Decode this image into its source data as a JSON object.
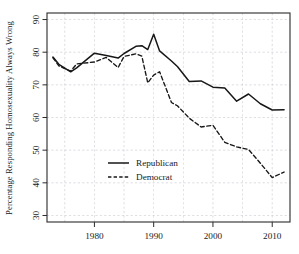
{
  "chart_data": {
    "type": "line",
    "title": "",
    "subtitle": "",
    "xlabel": "",
    "ylabel": "Percentage Responding Homosexuality Always Wrong",
    "xlim": [
      1972,
      2013
    ],
    "ylim": [
      28,
      92
    ],
    "yticks": [
      30,
      40,
      50,
      60,
      70,
      80,
      90
    ],
    "ytick_labels": [
      "30",
      "40",
      "50",
      "60",
      "70",
      "80",
      "90"
    ],
    "xticks": [
      1980,
      1990,
      2000,
      2010
    ],
    "xtick_labels": [
      "1980",
      "1990",
      "2000",
      "2010"
    ],
    "grid": true,
    "grid_style": "dashed",
    "legend_position": "center-left",
    "series": [
      {
        "name": "Republican",
        "style": "solid",
        "color": "#171717",
        "x": [
          1973,
          1974,
          1976,
          1977,
          1980,
          1982,
          1984,
          1985,
          1987,
          1988,
          1989,
          1990,
          1991,
          1993,
          1994,
          1996,
          1998,
          2000,
          2002,
          2004,
          2006,
          2008,
          2010,
          2012
        ],
        "values": [
          78.5,
          76.3,
          74.0,
          75.2,
          79.7,
          79.0,
          78.2,
          79.6,
          81.8,
          82.0,
          80.8,
          85.5,
          80.4,
          77.3,
          75.6,
          71.0,
          71.2,
          69.3,
          69.0,
          65.0,
          67.2,
          64.2,
          62.3,
          62.4
        ]
      },
      {
        "name": "Democrat",
        "style": "dashed",
        "color": "#171717",
        "x": [
          1973,
          1974,
          1976,
          1977,
          1980,
          1982,
          1984,
          1985,
          1987,
          1988,
          1989,
          1990,
          1991,
          1993,
          1994,
          1996,
          1998,
          2000,
          2002,
          2004,
          2006,
          2008,
          2010,
          2012
        ],
        "values": [
          78.3,
          75.8,
          74.2,
          76.4,
          77.0,
          78.4,
          75.3,
          78.7,
          79.5,
          78.8,
          70.6,
          73.0,
          74.0,
          64.6,
          63.6,
          59.8,
          57.1,
          57.6,
          52.4,
          51.0,
          50.2,
          46.0,
          41.6,
          43.3
        ]
      }
    ]
  },
  "legend": {
    "entries": [
      {
        "label": "Republican",
        "style": "solid"
      },
      {
        "label": "Democrat",
        "style": "dashed"
      }
    ]
  }
}
